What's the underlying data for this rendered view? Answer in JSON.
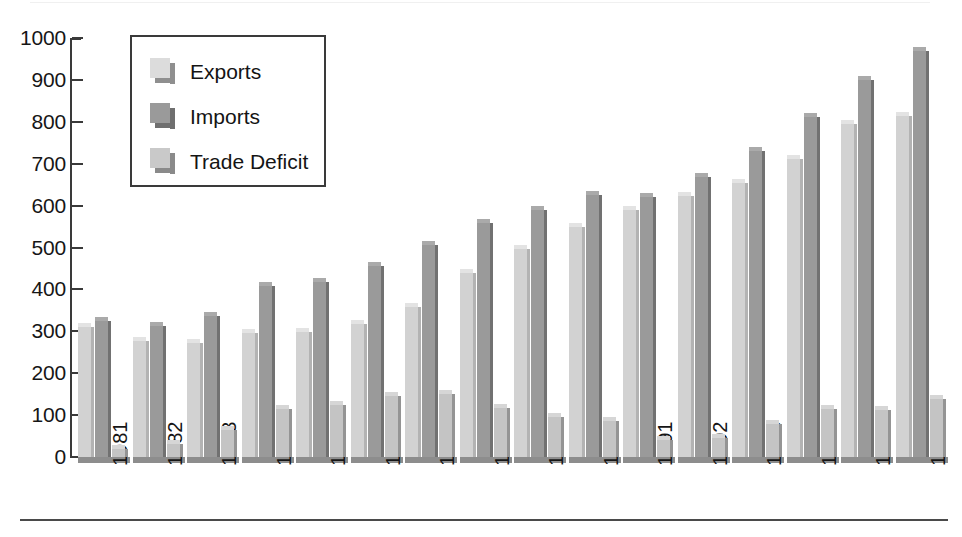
{
  "chart_data": {
    "type": "bar",
    "title": "",
    "subtitle": "",
    "xlabel": "",
    "ylabel": "",
    "ylim": [
      0,
      1000
    ],
    "yticks": [
      0,
      100,
      200,
      300,
      400,
      500,
      600,
      700,
      800,
      900,
      1000
    ],
    "ytick_labels": [
      "0",
      "100",
      "200",
      "300",
      "400",
      "500",
      "600",
      "700",
      "800",
      "900",
      "1000"
    ],
    "grid": false,
    "legend_position": "upper-left-inside",
    "categories": [
      "1981",
      "1982",
      "1983",
      "1984",
      "1985",
      "1986",
      "1987",
      "1988",
      "1989",
      "1990",
      "1991",
      "1992",
      "1993",
      "1994",
      "1995",
      "1996"
    ],
    "series": [
      {
        "name": "Exports",
        "color": "#d2d2d2",
        "values": [
          310,
          278,
          272,
          295,
          298,
          318,
          358,
          438,
          497,
          548,
          590,
          622,
          655,
          712,
          795,
          815
        ]
      },
      {
        "name": "Imports",
        "color": "#9a9a9a",
        "values": [
          325,
          312,
          337,
          407,
          418,
          457,
          505,
          558,
          590,
          625,
          620,
          668,
          730,
          812,
          900,
          968
        ]
      },
      {
        "name": "Trade Deficit",
        "color": "#c4c4c4",
        "values": [
          20,
          32,
          65,
          115,
          125,
          145,
          150,
          118,
          95,
          85,
          40,
          45,
          78,
          115,
          113,
          138
        ]
      }
    ]
  },
  "legend": {
    "items": [
      {
        "label": "Exports"
      },
      {
        "label": "Imports"
      },
      {
        "label": "Trade Deficit"
      }
    ]
  },
  "colors": {
    "exports": "#d2d2d2",
    "imports": "#9a9a9a",
    "trade_deficit": "#c4c4c4",
    "axis": "#3a3a3a",
    "text": "#161616",
    "background": "#ffffff"
  }
}
